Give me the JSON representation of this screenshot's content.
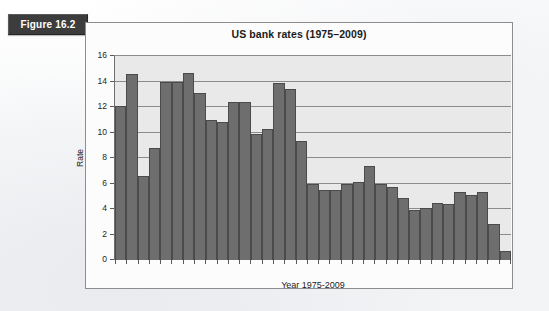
{
  "figure": {
    "badge_label": "Figure 16.2"
  },
  "chart_data": {
    "type": "bar",
    "title": "US bank rates (1975–2009)",
    "xlabel": "Year 1975-2009",
    "ylabel": "Rate",
    "ylim": [
      0,
      16
    ],
    "ytick_labels": [
      "16",
      "14",
      "12",
      "10",
      "8",
      "6",
      "4",
      "2",
      "0"
    ],
    "ytick_values": [
      16,
      14,
      12,
      10,
      8,
      6,
      4,
      2,
      0
    ],
    "grid": true,
    "legend": "none",
    "categories": [
      "1975",
      "1976",
      "1977",
      "1978",
      "1979",
      "1980",
      "1981",
      "1982",
      "1983",
      "1984",
      "1985",
      "1986",
      "1987",
      "1988",
      "1989",
      "1990",
      "1991",
      "1992",
      "1993",
      "1994",
      "1995",
      "1996",
      "1997",
      "1998",
      "1999",
      "2000",
      "2001",
      "2002",
      "2003",
      "2004",
      "2005",
      "2006",
      "2007",
      "2008",
      "2009"
    ],
    "values": [
      12.1,
      14.6,
      6.6,
      8.8,
      14.0,
      14.0,
      14.7,
      13.1,
      11.0,
      10.8,
      12.4,
      12.4,
      9.9,
      10.3,
      13.9,
      13.4,
      9.3,
      6.0,
      5.5,
      5.5,
      6.0,
      6.1,
      7.4,
      6.0,
      5.7,
      4.9,
      3.9,
      4.1,
      4.5,
      4.4,
      5.3,
      5.1,
      5.3,
      2.8,
      0.7
    ],
    "colors": {
      "bar_fill": "#6e6e6e",
      "bar_edge": "#4b4b4b",
      "plot_background": "#e9e9e9",
      "gridline": "#8b8b8b",
      "frame_border": "#8d8d8d",
      "badge_background": "#3c3c3c",
      "badge_text": "#ffffff"
    }
  }
}
